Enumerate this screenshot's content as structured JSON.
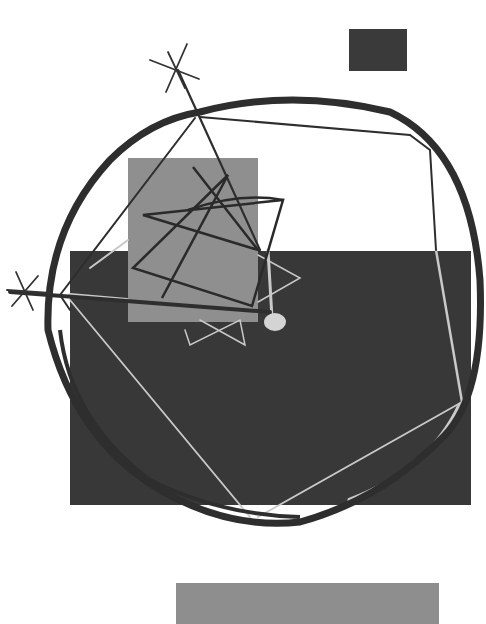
{
  "artwork": {
    "caption": "Abstract geometric composition: rectangles, a large loose circle, stars and a polygonal line drawing",
    "colors": {
      "background": "#ffffff",
      "dark": "#3a3a3a",
      "mid_gray": "#8e8e8e",
      "light_line": "#c8c8c8",
      "stroke": "#2e2e2e"
    },
    "shapes": {
      "small_dark_rect": {
        "x": 349,
        "y": 29,
        "w": 58,
        "h": 42
      },
      "large_dark_rect": {
        "x": 70,
        "y": 251,
        "w": 401,
        "h": 254
      },
      "gray_rect": {
        "x": 128,
        "y": 158,
        "w": 130,
        "h": 164
      },
      "bottom_gray_rect": {
        "x": 176,
        "y": 583,
        "w": 263,
        "h": 41
      }
    }
  }
}
